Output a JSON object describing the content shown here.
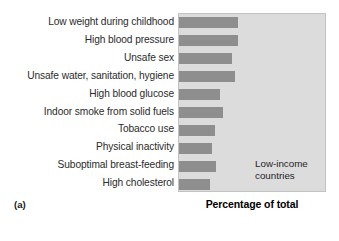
{
  "figure": {
    "panel_label": "(a)",
    "annotation": "Low-income\ncountries",
    "annotation_line1": "Low-income",
    "annotation_line2": "countries"
  },
  "chart_data": {
    "type": "bar",
    "orientation": "horizontal",
    "title": "",
    "subtitle": "",
    "xlabel": "Percentage of total",
    "ylabel": "",
    "categories": [
      "Low weight during childhood",
      "High blood pressure",
      "Unsafe sex",
      "Unsafe water, sanitation, hygiene",
      "High blood glucose",
      "Indoor smoke from solid fuels",
      "Tobacco use",
      "Physical inactivity",
      "Suboptimal breast-feeding",
      "High cholesterol"
    ],
    "values": [
      40,
      40,
      36,
      38,
      28,
      30,
      24,
      22,
      25,
      21
    ],
    "xlim": [
      0,
      100
    ],
    "grid": false,
    "legend": "none",
    "annotations": [
      "Low-income countries",
      "(a)"
    ],
    "series": [
      {
        "name": "Low-income countries",
        "values": [
          40,
          40,
          36,
          38,
          28,
          30,
          24,
          22,
          25,
          21
        ]
      }
    ],
    "colors": {
      "bar": "#8e8e8e",
      "plot_background": "#dcdcdc",
      "plot_border": "#c2c2c2",
      "text": "#1a1a1a",
      "page_background": "#ffffff"
    }
  }
}
